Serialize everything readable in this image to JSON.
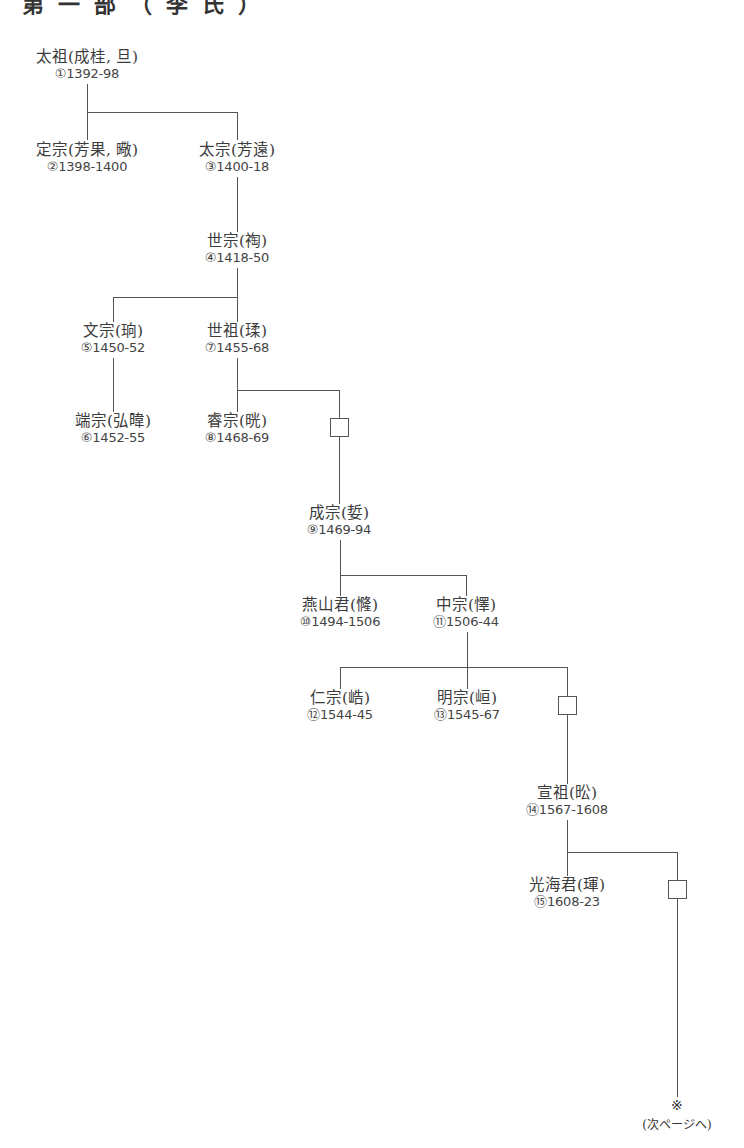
{
  "heading": "第一部（李氏）",
  "nodes": [
    {
      "id": "taejo",
      "name": "太祖(成桂, 旦)",
      "reign": "①1392-98"
    },
    {
      "id": "jeongjong",
      "name": "定宗(芳果, 曔)",
      "reign": "②1398-1400"
    },
    {
      "id": "taejong",
      "name": "太宗(芳遠)",
      "reign": "③1400-18"
    },
    {
      "id": "sejong",
      "name": "世宗(祹)",
      "reign": "④1418-50"
    },
    {
      "id": "munjong",
      "name": "文宗(珦)",
      "reign": "⑤1450-52"
    },
    {
      "id": "danjong",
      "name": "端宗(弘暐)",
      "reign": "⑥1452-55"
    },
    {
      "id": "sejo",
      "name": "世祖(瑈)",
      "reign": "⑦1455-68"
    },
    {
      "id": "yejong",
      "name": "睿宗(晄)",
      "reign": "⑧1468-69"
    },
    {
      "id": "seongjong",
      "name": "成宗(娎)",
      "reign": "⑨1469-94"
    },
    {
      "id": "yeonsangun",
      "name": "燕山君(㦕)",
      "reign": "⑩1494-1506"
    },
    {
      "id": "jungjong",
      "name": "中宗(懌)",
      "reign": "⑪1506-44"
    },
    {
      "id": "injong",
      "name": "仁宗(峼)",
      "reign": "⑫1544-45"
    },
    {
      "id": "myeongjong",
      "name": "明宗(峘)",
      "reign": "⑬1545-67"
    },
    {
      "id": "seonjo",
      "name": "宣祖(昖)",
      "reign": "⑭1567-1608"
    },
    {
      "id": "gwanghaegun",
      "name": "光海君(琿)",
      "reign": "⑮1608-23"
    }
  ],
  "continuation": {
    "mark": "※",
    "label": "(次ページへ)"
  }
}
